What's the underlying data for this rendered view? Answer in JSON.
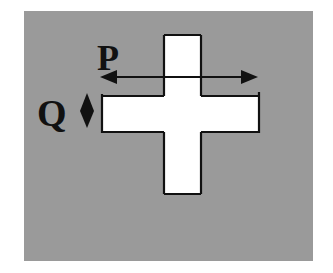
{
  "diagram": {
    "type": "cross-shape-dimension-figure",
    "background_color": "#9a9a9a",
    "shape_fill": "#ffffff",
    "stroke_color": "#111111",
    "labels": {
      "p": "P",
      "q": "Q"
    },
    "dimensions": [
      {
        "label": "P",
        "direction": "horizontal",
        "meaning": "width of horizontal arm"
      },
      {
        "label": "Q",
        "direction": "vertical",
        "meaning": "height of horizontal arm"
      }
    ]
  }
}
